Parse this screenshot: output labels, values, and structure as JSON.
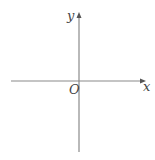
{
  "diagram": {
    "type": "cartesian-axes",
    "x_axis_label": "x",
    "y_axis_label": "y",
    "origin_label": "O",
    "axis_color": "#8a8a8a",
    "label_color": "#444444"
  }
}
